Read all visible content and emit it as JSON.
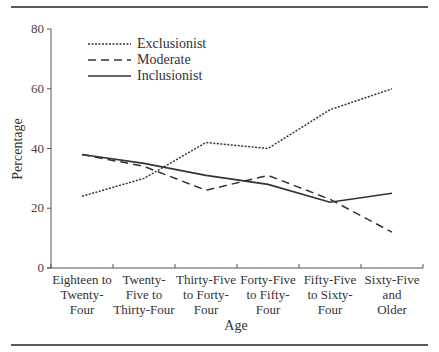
{
  "chart_data": {
    "type": "line",
    "title": "",
    "xlabel": "Age",
    "ylabel": "Percentage",
    "ylim": [
      0,
      80
    ],
    "yticks": [
      0,
      20,
      40,
      60,
      80
    ],
    "grid": false,
    "legend_position": "upper-left",
    "categories": [
      [
        "Eighteen to",
        "Twenty-",
        "Four"
      ],
      [
        "Twenty-",
        "Five to",
        "Thirty-Four"
      ],
      [
        "Thirty-Five",
        "to Forty-",
        "Four"
      ],
      [
        "Forty-Five",
        "to Fifty-",
        "Four"
      ],
      [
        "Fifty-Five",
        "to Sixty-",
        "Four"
      ],
      [
        "Sixty-Five",
        "and",
        "Older"
      ]
    ],
    "series": [
      {
        "name": "Exclusionist",
        "style": "dotted",
        "values": [
          24,
          30,
          42,
          40,
          53,
          60
        ]
      },
      {
        "name": "Moderate",
        "style": "dashed",
        "values": [
          38,
          34,
          26,
          31,
          23,
          12
        ]
      },
      {
        "name": "Inclusionist",
        "style": "solid",
        "values": [
          38,
          35,
          31,
          28,
          22,
          25
        ]
      }
    ]
  },
  "colors": {
    "line": "#333333",
    "axis": "#555555",
    "rule": "#222222"
  }
}
